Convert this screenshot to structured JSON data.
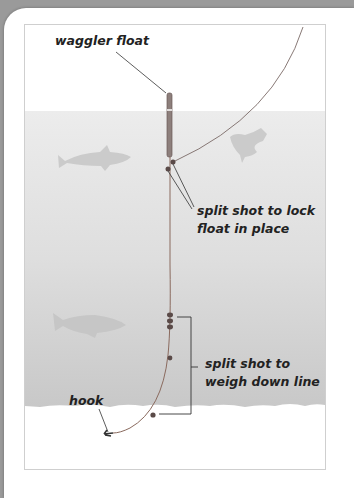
{
  "diagram": {
    "labels": {
      "waggler_float": "waggler float",
      "split_shot_lock_line1": "split shot to lock",
      "split_shot_lock_line2": "float in place",
      "split_shot_weigh_line1": "split shot to",
      "split_shot_weigh_line2": "weigh down line",
      "hook": "hook"
    },
    "colors": {
      "water": "#e4e4e4",
      "water_deep": "#c9c9c9",
      "line": "#7a5a4a",
      "float": "#8a7a78",
      "shot": "#5a4a48",
      "fish": "#cdcdcd",
      "text": "#222222"
    },
    "elements": [
      "fishing line",
      "waggler float",
      "split shot",
      "hook",
      "fish silhouettes",
      "water"
    ]
  }
}
